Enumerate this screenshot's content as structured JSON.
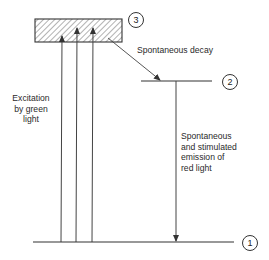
{
  "levels": {
    "level_3": {
      "label": "3",
      "style": "hatched band"
    },
    "level_2": {
      "label": "2"
    },
    "level_1": {
      "label": "1"
    }
  },
  "labels": {
    "excitation_line1": "Excitation",
    "excitation_line2": "by green",
    "excitation_line3": "light",
    "decay": "Spontaneous decay",
    "emission_line1": "Spontaneous",
    "emission_line2": "and stimulated",
    "emission_line3": "emission of",
    "emission_line4": "red light"
  },
  "colors": {
    "line": "#333333",
    "hatch": "#555555",
    "background": "#ffffff"
  }
}
